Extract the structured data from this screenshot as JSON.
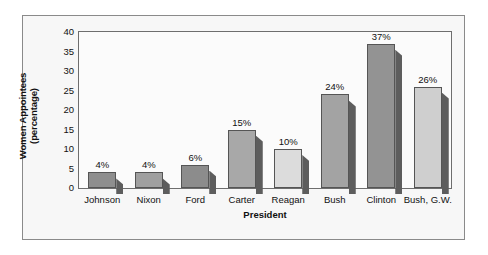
{
  "chart_data": {
    "type": "bar",
    "title": "",
    "xlabel": "President",
    "ylabel_line1": "Women Appointees",
    "ylabel_line2": "(percentage)",
    "categories": [
      "Johnson",
      "Nixon",
      "Ford",
      "Carter",
      "Reagan",
      "Bush",
      "Clinton",
      "Bush, G.W."
    ],
    "values": [
      4,
      4,
      6,
      15,
      10,
      24,
      37,
      26
    ],
    "value_labels": [
      "4%",
      "4%",
      "6%",
      "15%",
      "10%",
      "24%",
      "37%",
      "26%"
    ],
    "ylim": [
      0,
      40
    ],
    "yticks": [
      0,
      5,
      10,
      15,
      20,
      25,
      30,
      35,
      40
    ],
    "ytick_labels": [
      "0",
      "5",
      "10",
      "15",
      "20",
      "25",
      "30",
      "35",
      "40"
    ],
    "grid": false,
    "legend": "none",
    "bar_colors": [
      "#8e8e8e",
      "#a0a0a0",
      "#8c8c8c",
      "#a8a8a8",
      "#dcdcdc",
      "#a3a3a3",
      "#939393",
      "#cfcfcf"
    ],
    "frame_color": "#8a8a8a",
    "plot_bg": "#fbfbfb",
    "axis_color": "#6e6e6e"
  }
}
